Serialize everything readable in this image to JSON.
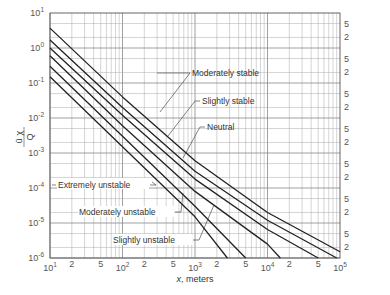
{
  "chart_data": {
    "type": "line",
    "title": "",
    "xlabel": "x, meters",
    "ylabel": "ūχ/Q",
    "xscale": "log",
    "yscale": "log",
    "xlim": [
      10,
      100000
    ],
    "ylim": [
      1e-06,
      10
    ],
    "grid": true,
    "x_major_ticks": [
      "10^1",
      "10^2",
      "10^3",
      "10^4",
      "10^5"
    ],
    "x_minor_tick_labels": [
      "2",
      "5"
    ],
    "y_major_ticks": [
      "10^1",
      "10^0",
      "10^-1",
      "10^-2",
      "10^-3",
      "10^-4",
      "10^-5",
      "10^-6"
    ],
    "y_right_minor_tick_labels": [
      "5",
      "2"
    ],
    "series": [
      {
        "name": "Extremely unstable",
        "x": [
          10,
          100,
          1000,
          2800
        ],
        "y": [
          0.15,
          0.0015,
          1.5e-05,
          1e-06
        ]
      },
      {
        "name": "Moderately unstable",
        "x": [
          10,
          100,
          1000,
          5000
        ],
        "y": [
          0.3,
          0.003,
          3e-05,
          1e-06
        ]
      },
      {
        "name": "Slightly unstable",
        "x": [
          10,
          100,
          1000,
          10000,
          15000
        ],
        "y": [
          0.6,
          0.006,
          8e-05,
          2.5e-06,
          1e-06
        ]
      },
      {
        "name": "Neutral",
        "x": [
          10,
          100,
          1000,
          10000,
          50000
        ],
        "y": [
          1.0,
          0.012,
          0.00018,
          6.5e-06,
          1e-06
        ]
      },
      {
        "name": "Slightly stable",
        "x": [
          10,
          100,
          1000,
          10000,
          90000
        ],
        "y": [
          1.7,
          0.02,
          0.0003,
          1.2e-05,
          1e-06
        ]
      },
      {
        "name": "Moderately stable",
        "x": [
          10,
          100,
          1000,
          10000,
          100000
        ],
        "y": [
          3.7,
          0.04,
          0.0006,
          2e-05,
          1.5e-06
        ]
      }
    ]
  },
  "labels": {
    "moderately_stable": "Moderately stable",
    "slightly_stable": "Slightly stable",
    "neutral": "Neutral",
    "extremely_unstable": "Extremely unstable",
    "moderately_unstable": "Moderately unstable",
    "slightly_unstable": "Slightly unstable"
  },
  "axes": {
    "x_title": ", meters",
    "x_title_var": "x",
    "y_title_num": "ū χ",
    "y_title_den": "Q",
    "x_ticks": [
      {
        "base": "10",
        "exp": "1"
      },
      {
        "minor": "2"
      },
      {
        "minor": "5"
      },
      {
        "base": "10",
        "exp": "2"
      },
      {
        "minor": "2"
      },
      {
        "minor": "5"
      },
      {
        "base": "10",
        "exp": "3"
      },
      {
        "minor": "2"
      },
      {
        "minor": "5"
      },
      {
        "base": "10",
        "exp": "4"
      },
      {
        "minor": "2"
      },
      {
        "minor": "5"
      },
      {
        "base": "10",
        "exp": "5"
      }
    ],
    "y_ticks": [
      {
        "base": "10",
        "exp": "1"
      },
      {
        "base": "10",
        "exp": "0"
      },
      {
        "base": "10",
        "exp": "-1"
      },
      {
        "base": "10",
        "exp": "-2"
      },
      {
        "base": "10",
        "exp": "-3"
      },
      {
        "base": "10",
        "exp": "-4"
      },
      {
        "base": "10",
        "exp": "-5"
      },
      {
        "base": "10",
        "exp": "-6"
      }
    ],
    "right_minor": {
      "five": "5",
      "two": "2"
    }
  }
}
